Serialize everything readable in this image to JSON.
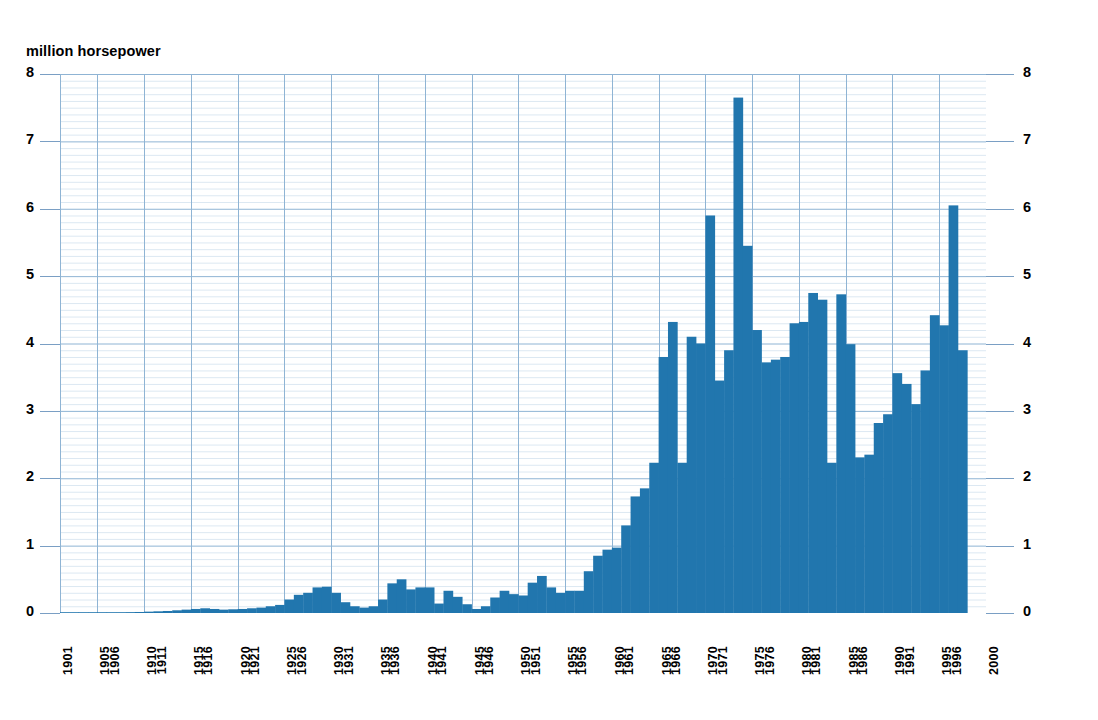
{
  "chart_data": {
    "type": "bar",
    "title": "million horsepower",
    "xlabel": "",
    "ylabel": "million horsepower",
    "ylim": [
      0,
      8
    ],
    "xlim": [
      1901,
      2000
    ],
    "grid": true,
    "legend": null,
    "bar_color": "#2176AE",
    "grid_color_major": "#8fb4d4",
    "grid_color_minor": "#dce8f2",
    "axis_tick_labels_left": [
      "0",
      "1",
      "2",
      "3",
      "4",
      "5",
      "6",
      "7",
      "8"
    ],
    "axis_tick_labels_right": [
      "0",
      "1",
      "2",
      "3",
      "4",
      "5",
      "6",
      "7",
      "8"
    ],
    "y_ticks": [
      0,
      1,
      2,
      3,
      4,
      5,
      6,
      7,
      8
    ],
    "x_tick_labels": [
      "1901",
      "1905",
      "1906",
      "1910",
      "1911",
      "1915",
      "1916",
      "1920",
      "1921",
      "1925",
      "1926",
      "1930",
      "1931",
      "1935",
      "1936",
      "1940",
      "1941",
      "1945",
      "1946",
      "1950",
      "1951",
      "1955",
      "1956",
      "1960",
      "1961",
      "1965",
      "1966",
      "1970",
      "1971",
      "1975",
      "1976",
      "1980",
      "1981",
      "1985",
      "1986",
      "1990",
      "1991",
      "1995",
      "1996",
      "2000"
    ],
    "x_gridline_years": [
      1901,
      1905,
      1910,
      1915,
      1920,
      1925,
      1930,
      1935,
      1940,
      1945,
      1950,
      1955,
      1960,
      1965,
      1970,
      1975,
      1980,
      1985,
      1990,
      1995,
      2000
    ],
    "x": [
      1901,
      1902,
      1903,
      1904,
      1905,
      1906,
      1907,
      1908,
      1909,
      1910,
      1911,
      1912,
      1913,
      1914,
      1915,
      1916,
      1917,
      1918,
      1919,
      1920,
      1921,
      1922,
      1923,
      1924,
      1925,
      1926,
      1927,
      1928,
      1929,
      1930,
      1931,
      1932,
      1933,
      1934,
      1935,
      1936,
      1937,
      1938,
      1939,
      1940,
      1941,
      1942,
      1943,
      1944,
      1945,
      1946,
      1947,
      1948,
      1949,
      1950,
      1951,
      1952,
      1953,
      1954,
      1955,
      1956,
      1957,
      1958,
      1959,
      1960,
      1961,
      1962,
      1963,
      1964,
      1965,
      1966,
      1967,
      1968,
      1969,
      1970,
      1971,
      1972,
      1973,
      1974,
      1975,
      1976,
      1977,
      1978,
      1979,
      1980,
      1981,
      1982,
      1983,
      1984,
      1985,
      1986,
      1987,
      1988,
      1989,
      1990,
      1991,
      1992,
      1993,
      1994,
      1995,
      1996,
      1997
    ],
    "values": [
      0.005,
      0.005,
      0.006,
      0.007,
      0.008,
      0.01,
      0.012,
      0.013,
      0.015,
      0.02,
      0.025,
      0.03,
      0.04,
      0.05,
      0.06,
      0.07,
      0.06,
      0.05,
      0.055,
      0.06,
      0.07,
      0.08,
      0.1,
      0.12,
      0.2,
      0.27,
      0.3,
      0.38,
      0.39,
      0.3,
      0.16,
      0.1,
      0.08,
      0.1,
      0.2,
      0.44,
      0.5,
      0.35,
      0.38,
      0.38,
      0.14,
      0.33,
      0.24,
      0.13,
      0.06,
      0.1,
      0.23,
      0.33,
      0.28,
      0.26,
      0.45,
      0.55,
      0.38,
      0.3,
      0.33,
      0.33,
      0.62,
      0.85,
      0.94,
      0.97,
      1.3,
      1.73,
      1.85,
      2.23,
      3.8,
      4.32,
      2.23,
      4.1,
      4.0,
      5.9,
      3.45,
      3.9,
      7.65,
      5.45,
      4.2,
      3.72,
      3.76,
      3.8,
      4.3,
      4.32,
      4.75,
      4.65,
      2.23,
      4.73,
      3.99,
      2.31,
      2.35,
      2.82,
      2.95,
      3.56,
      3.4,
      3.1,
      3.6,
      4.42,
      4.27,
      6.05,
      3.9
    ]
  }
}
